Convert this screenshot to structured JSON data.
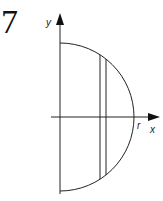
{
  "problem_number": "7",
  "diagram": {
    "axes": {
      "x_label": "x",
      "y_label": "y"
    },
    "labels": {
      "radius": "r"
    },
    "shape": "right half of a circle of radius r centered at origin",
    "strip": "thin vertical strip between two vertical lines inside the half-disk"
  }
}
